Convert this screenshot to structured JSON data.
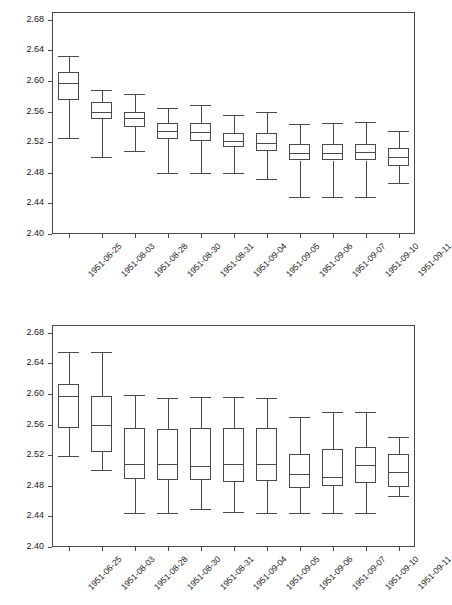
{
  "chart_data": [
    {
      "type": "box",
      "panel": "top",
      "title": "",
      "xlabel": "",
      "ylabel": "",
      "ylim": [
        2.4,
        2.69
      ],
      "yticks": [
        2.4,
        2.44,
        2.48,
        2.52,
        2.56,
        2.6,
        2.64,
        2.68
      ],
      "ytick_labels": [
        "2.40",
        "2.44",
        "2.48",
        "2.52",
        "2.56",
        "2.60",
        "2.64",
        "2.68"
      ],
      "grid": false,
      "legend": "none",
      "categories": [
        "1951-06-25",
        "1951-08-03",
        "1951-08-28",
        "1951-08-30",
        "1951-08-31",
        "1951-09-04",
        "1951-09-05",
        "1951-09-06",
        "1951-09-07",
        "1951-09-10",
        "1951-09-11"
      ],
      "boxes": [
        {
          "category": "1951-06-25",
          "whisker_low": 2.525,
          "q1": 2.575,
          "median": 2.597,
          "q3": 2.611,
          "whisker_high": 2.632
        },
        {
          "category": "1951-08-03",
          "whisker_low": 2.5,
          "q1": 2.55,
          "median": 2.56,
          "q3": 2.572,
          "whisker_high": 2.588
        },
        {
          "category": "1951-08-28",
          "whisker_low": 2.508,
          "q1": 2.54,
          "median": 2.551,
          "q3": 2.56,
          "whisker_high": 2.583
        },
        {
          "category": "1951-08-30",
          "whisker_low": 2.48,
          "q1": 2.524,
          "median": 2.534,
          "q3": 2.545,
          "whisker_high": 2.565
        },
        {
          "category": "1951-08-31",
          "whisker_low": 2.48,
          "q1": 2.522,
          "median": 2.533,
          "q3": 2.545,
          "whisker_high": 2.568
        },
        {
          "category": "1951-09-04",
          "whisker_low": 2.48,
          "q1": 2.514,
          "median": 2.521,
          "q3": 2.532,
          "whisker_high": 2.556
        },
        {
          "category": "1951-09-05",
          "whisker_low": 2.472,
          "q1": 2.508,
          "median": 2.519,
          "q3": 2.532,
          "whisker_high": 2.56
        },
        {
          "category": "1951-09-06",
          "whisker_low": 2.448,
          "q1": 2.496,
          "median": 2.506,
          "q3": 2.517,
          "whisker_high": 2.544
        },
        {
          "category": "1951-09-07",
          "whisker_low": 2.448,
          "q1": 2.496,
          "median": 2.506,
          "q3": 2.517,
          "whisker_high": 2.545
        },
        {
          "category": "1951-09-10",
          "whisker_low": 2.448,
          "q1": 2.496,
          "median": 2.507,
          "q3": 2.518,
          "whisker_high": 2.546
        },
        {
          "category": "1951-09-11",
          "whisker_low": 2.466,
          "q1": 2.489,
          "median": 2.5,
          "q3": 2.512,
          "whisker_high": 2.534
        }
      ]
    },
    {
      "type": "box",
      "panel": "bottom",
      "title": "",
      "xlabel": "",
      "ylabel": "",
      "ylim": [
        2.4,
        2.69
      ],
      "yticks": [
        2.4,
        2.44,
        2.48,
        2.52,
        2.56,
        2.6,
        2.64,
        2.68
      ],
      "ytick_labels": [
        "2.40",
        "2.44",
        "2.48",
        "2.52",
        "2.56",
        "2.60",
        "2.64",
        "2.68"
      ],
      "grid": false,
      "legend": "none",
      "categories": [
        "1951-06-25",
        "1951-08-03",
        "1951-08-28",
        "1951-08-30",
        "1951-08-31",
        "1951-09-04",
        "1951-09-05",
        "1951-09-06",
        "1951-09-07",
        "1951-09-10",
        "1951-09-11"
      ],
      "boxes": [
        {
          "category": "1951-06-25",
          "whisker_low": 2.519,
          "q1": 2.556,
          "median": 2.597,
          "q3": 2.613,
          "whisker_high": 2.655
        },
        {
          "category": "1951-08-03",
          "whisker_low": 2.5,
          "q1": 2.524,
          "median": 2.559,
          "q3": 2.597,
          "whisker_high": 2.655
        },
        {
          "category": "1951-08-28",
          "whisker_low": 2.444,
          "q1": 2.489,
          "median": 2.509,
          "q3": 2.556,
          "whisker_high": 2.599
        },
        {
          "category": "1951-08-30",
          "whisker_low": 2.444,
          "q1": 2.487,
          "median": 2.508,
          "q3": 2.554,
          "whisker_high": 2.594
        },
        {
          "category": "1951-08-31",
          "whisker_low": 2.45,
          "q1": 2.487,
          "median": 2.506,
          "q3": 2.556,
          "whisker_high": 2.596
        },
        {
          "category": "1951-09-04",
          "whisker_low": 2.446,
          "q1": 2.485,
          "median": 2.508,
          "q3": 2.556,
          "whisker_high": 2.596
        },
        {
          "category": "1951-09-05",
          "whisker_low": 2.444,
          "q1": 2.486,
          "median": 2.508,
          "q3": 2.556,
          "whisker_high": 2.594
        },
        {
          "category": "1951-09-06",
          "whisker_low": 2.444,
          "q1": 2.477,
          "median": 2.496,
          "q3": 2.522,
          "whisker_high": 2.57
        },
        {
          "category": "1951-09-07",
          "whisker_low": 2.444,
          "q1": 2.48,
          "median": 2.492,
          "q3": 2.528,
          "whisker_high": 2.577
        },
        {
          "category": "1951-09-10",
          "whisker_low": 2.444,
          "q1": 2.483,
          "median": 2.507,
          "q3": 2.531,
          "whisker_high": 2.577
        },
        {
          "category": "1951-09-11",
          "whisker_low": 2.466,
          "q1": 2.478,
          "median": 2.498,
          "q3": 2.522,
          "whisker_high": 2.544
        }
      ]
    }
  ]
}
